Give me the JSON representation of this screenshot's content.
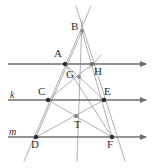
{
  "figure": {
    "kind": "geometry-diagram",
    "width": 155,
    "height": 168,
    "background_color": "#ffffff",
    "stroke_color_primary": "#6e6e6e",
    "stroke_color_thin": "#9a9a9a",
    "point_color": "#3a3a3a",
    "label_color": "#2b2b2b"
  },
  "points": [
    {
      "id": "B",
      "label": "B",
      "x": 82,
      "y": 31,
      "label_x": 71,
      "label_y": 25,
      "filled": false
    },
    {
      "id": "A",
      "label": "A",
      "x": 65,
      "y": 64,
      "label_x": 55,
      "label_y": 50,
      "filled": true
    },
    {
      "id": "H",
      "label": "H",
      "x": 92,
      "y": 64,
      "label_x": 94,
      "label_y": 66,
      "filled": false
    },
    {
      "id": "G",
      "label": "G",
      "x": 79,
      "y": 77,
      "label_x": 66,
      "label_y": 71,
      "filled": false
    },
    {
      "id": "C",
      "label": "C",
      "x": 48,
      "y": 100,
      "label_x": 38,
      "label_y": 88,
      "filled": true
    },
    {
      "id": "E",
      "label": "E",
      "x": 104,
      "y": 100,
      "label_x": 104,
      "label_y": 88,
      "filled": true
    },
    {
      "id": "T",
      "label": "T",
      "x": 76,
      "y": 116,
      "label_x": 74,
      "label_y": 120,
      "filled": false
    },
    {
      "id": "D",
      "label": "D",
      "x": 36,
      "y": 137,
      "label_x": 31,
      "label_y": 139,
      "filled": true
    },
    {
      "id": "F",
      "label": "F",
      "x": 112,
      "y": 137,
      "label_x": 108,
      "label_y": 139,
      "filled": true
    }
  ],
  "line_labels": [
    {
      "id": "k",
      "label": "k",
      "x": 10,
      "y": 92
    },
    {
      "id": "m",
      "label": "m",
      "x": 9,
      "y": 129
    }
  ],
  "parallel_lines": [
    {
      "id": "top-line",
      "y": 64,
      "x_start": 8,
      "x_end": 150,
      "has_arrow": true,
      "label": ""
    },
    {
      "id": "line-k",
      "y": 100,
      "x_start": 8,
      "x_end": 150,
      "has_arrow": true,
      "label": "k"
    },
    {
      "id": "line-m",
      "y": 137,
      "x_start": 8,
      "x_end": 150,
      "has_arrow": true,
      "label": "m"
    }
  ],
  "segments": [
    {
      "id": "left-side",
      "x1": 91,
      "y1": 6,
      "x2": 24,
      "y2": 161
    },
    {
      "id": "right-side",
      "x1": 76,
      "y1": 6,
      "x2": 125,
      "y2": 161
    },
    {
      "id": "vertical-axis",
      "x1": 82,
      "y1": 20,
      "x2": 77,
      "y2": 161
    },
    {
      "id": "B-to-D",
      "x1": 82,
      "y1": 31,
      "x2": 36,
      "y2": 137
    },
    {
      "id": "B-to-F",
      "x1": 82,
      "y1": 31,
      "x2": 112,
      "y2": 137
    },
    {
      "id": "A-to-E",
      "x1": 65,
      "y1": 64,
      "x2": 104,
      "y2": 100
    },
    {
      "id": "A-to-F",
      "x1": 65,
      "y1": 64,
      "x2": 112,
      "y2": 137
    },
    {
      "id": "C-to-H",
      "x1": 48,
      "y1": 100,
      "x2": 92,
      "y2": 64
    },
    {
      "id": "C-to-F",
      "x1": 48,
      "y1": 100,
      "x2": 112,
      "y2": 137
    },
    {
      "id": "D-to-E",
      "x1": 36,
      "y1": 137,
      "x2": 104,
      "y2": 100
    },
    {
      "id": "C-to-E-chord",
      "x1": 48,
      "y1": 100,
      "x2": 104,
      "y2": 100
    },
    {
      "id": "H-tick",
      "x1": 89,
      "y1": 69,
      "x2": 101,
      "y2": 55
    }
  ]
}
